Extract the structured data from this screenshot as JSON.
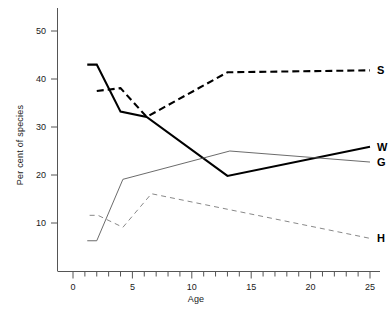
{
  "chart_data": {
    "type": "line",
    "title": "",
    "xlabel": "Age",
    "ylabel": "Per cent of species",
    "xlim": [
      0,
      26.2
    ],
    "ylim": [
      0,
      55
    ],
    "grid": false,
    "legend_position": "right-of-line-ends",
    "x_ticks_major": [
      0,
      5,
      10,
      15,
      20,
      25
    ],
    "x_ticks_minor_step": 1,
    "y_ticks_major": [
      10,
      20,
      30,
      40,
      50
    ],
    "series": [
      {
        "name": "S",
        "label": "S",
        "style": "thick-dashed",
        "color": "#000000",
        "x": [
          2,
          4,
          6.2,
          13,
          25
        ],
        "values": [
          37.5,
          38.1,
          32.1,
          41.4,
          41.8
        ]
      },
      {
        "name": "W",
        "label": "W",
        "style": "thick-solid",
        "color": "#000000",
        "x": [
          1.2,
          2,
          4,
          6.2,
          13,
          25
        ],
        "values": [
          43,
          43,
          33.2,
          32.1,
          19.8,
          25.9
        ]
      },
      {
        "name": "G",
        "label": "G",
        "style": "thin-solid",
        "color": "#5a5a5a",
        "x": [
          1.2,
          2,
          4.2,
          13.2,
          25
        ],
        "values": [
          6.3,
          6.3,
          19.1,
          25,
          22.7
        ]
      },
      {
        "name": "H",
        "label": "H",
        "style": "thin-dashed",
        "color": "#7a7a7a",
        "x": [
          1.4,
          2.1,
          4.2,
          6.6,
          25
        ],
        "values": [
          11.6,
          11.6,
          9.1,
          16.1,
          6.8
        ]
      }
    ]
  },
  "axis": {
    "x_title": "Age",
    "y_title": "Per cent of species",
    "x_tick_labels": [
      "0",
      "5",
      "10",
      "15",
      "20",
      "25"
    ],
    "y_tick_labels": [
      "10",
      "20",
      "30",
      "40",
      "50"
    ]
  },
  "legend": {
    "entries": [
      {
        "key": "S",
        "label": "S"
      },
      {
        "key": "W",
        "label": "W"
      },
      {
        "key": "G",
        "label": "G"
      },
      {
        "key": "H",
        "label": "H"
      }
    ]
  }
}
